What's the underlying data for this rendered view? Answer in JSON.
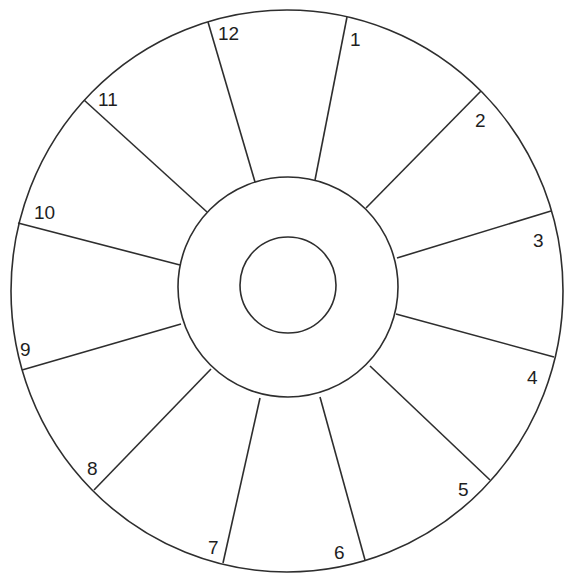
{
  "diagram": {
    "type": "twelve-segment wheel",
    "outer_circle": {
      "cx": 287,
      "cy": 291,
      "rx": 276,
      "ry": 281
    },
    "middle_circle": {
      "cx": 288,
      "cy": 287,
      "r": 110
    },
    "inner_circle": {
      "cx": 288,
      "cy": 285,
      "r": 48
    },
    "stroke_color": "#2e2e2e",
    "segments": [
      {
        "label": "1",
        "spoke": [
          347,
          17,
          315,
          180
        ],
        "label_pos": [
          350,
          46
        ]
      },
      {
        "label": "2",
        "spoke": [
          481,
          91,
          366,
          208
        ],
        "label_pos": [
          475,
          127
        ]
      },
      {
        "label": "3",
        "spoke": [
          551,
          211,
          397,
          258
        ],
        "label_pos": [
          533,
          247
        ]
      },
      {
        "label": "4",
        "spoke": [
          554,
          357,
          396,
          314
        ],
        "label_pos": [
          527,
          384
        ]
      },
      {
        "label": "5",
        "spoke": [
          490,
          480,
          370,
          366
        ],
        "label_pos": [
          458,
          496
        ]
      },
      {
        "label": "6",
        "spoke": [
          365,
          560,
          320,
          397
        ],
        "label_pos": [
          334,
          559
        ]
      },
      {
        "label": "7",
        "spoke": [
          223,
          563,
          260,
          398
        ],
        "label_pos": [
          208,
          554
        ]
      },
      {
        "label": "8",
        "spoke": [
          94,
          490,
          211,
          369
        ],
        "label_pos": [
          87,
          475
        ]
      },
      {
        "label": "9",
        "spoke": [
          22,
          370,
          181,
          324
        ],
        "label_pos": [
          20,
          356
        ]
      },
      {
        "label": "10",
        "spoke": [
          18,
          223,
          180,
          265
        ],
        "label_pos": [
          34,
          219
        ]
      },
      {
        "label": "11",
        "spoke": [
          84,
          100,
          207,
          212
        ],
        "label_pos": [
          98,
          106
        ]
      },
      {
        "label": "12",
        "spoke": [
          208,
          22,
          255,
          182
        ],
        "label_pos": [
          218,
          40
        ]
      }
    ]
  }
}
